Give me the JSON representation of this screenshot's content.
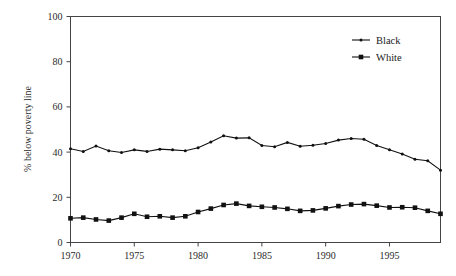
{
  "chart_data": {
    "type": "line",
    "title": "",
    "xlabel": "",
    "ylabel": "% below poverty line",
    "xlim": [
      1970,
      1999
    ],
    "ylim": [
      0,
      100
    ],
    "grid": false,
    "legend_position": "top-right",
    "xticks": [
      1970,
      1975,
      1980,
      1985,
      1990,
      1995
    ],
    "yticks": [
      0,
      20,
      40,
      60,
      80,
      100
    ],
    "x": [
      1970,
      1971,
      1972,
      1973,
      1974,
      1975,
      1976,
      1977,
      1978,
      1979,
      1980,
      1981,
      1982,
      1983,
      1984,
      1985,
      1986,
      1987,
      1988,
      1989,
      1990,
      1991,
      1992,
      1993,
      1994,
      1995,
      1996,
      1997,
      1998,
      1999
    ],
    "series": [
      {
        "name": "Black",
        "marker": "small-dot",
        "color": "#111111",
        "values": [
          41.5,
          40.3,
          42.7,
          40.6,
          39.8,
          41.0,
          40.3,
          41.3,
          41.0,
          40.6,
          41.9,
          44.5,
          47.2,
          46.2,
          46.3,
          42.9,
          42.4,
          44.3,
          42.6,
          43.0,
          43.8,
          45.3,
          46.0,
          45.7,
          42.9,
          41.0,
          39.2,
          36.8,
          36.2,
          32.0
        ]
      },
      {
        "name": "White",
        "marker": "square",
        "color": "#111111",
        "values": [
          10.7,
          11.0,
          10.2,
          9.7,
          11.0,
          12.7,
          11.4,
          11.6,
          11.0,
          11.6,
          13.5,
          15.0,
          16.6,
          17.2,
          16.2,
          15.8,
          15.5,
          14.9,
          14.0,
          14.2,
          15.1,
          16.1,
          16.8,
          17.0,
          16.3,
          15.5,
          15.6,
          15.4,
          14.0,
          12.7
        ]
      }
    ]
  },
  "legend": {
    "items": [
      {
        "label": "Black"
      },
      {
        "label": "White"
      }
    ]
  },
  "axes": {
    "y_title": "% below poverty line",
    "y_tick_labels": [
      "0",
      "20",
      "40",
      "60",
      "80",
      "100"
    ],
    "x_tick_labels": [
      "1970",
      "1975",
      "1980",
      "1985",
      "1990",
      "1995"
    ]
  }
}
